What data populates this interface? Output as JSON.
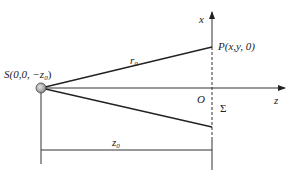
{
  "diagram": {
    "type": "optics-geometry",
    "colors": {
      "line": "#222222",
      "axis": "#333333",
      "source_fill": "#b0b0b0",
      "background": "#ffffff"
    },
    "labels": {
      "source": "S(0,0, −z",
      "source_sub": "0",
      "source_close": ")",
      "point": "P(x,y, 0)",
      "r": "r",
      "r_sub": "0",
      "x_axis": "x",
      "z_axis": "z",
      "origin": "O",
      "plane": "Σ",
      "distance": "z",
      "distance_sub": "0"
    }
  }
}
